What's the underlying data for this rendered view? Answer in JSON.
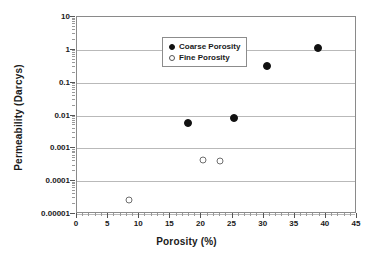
{
  "chart_data": {
    "type": "scatter",
    "title": "",
    "xlabel": "Porosity (%)",
    "ylabel": "Permeability (Darcys)",
    "xlim": [
      0,
      45
    ],
    "ylim": [
      1e-05,
      10
    ],
    "yscale": "log",
    "xscale": "linear",
    "grid": "horizontal-major-only",
    "legend_position": "top-left-inside",
    "xticks": [
      0,
      5,
      10,
      15,
      20,
      25,
      30,
      35,
      40,
      45
    ],
    "xtick_labels": [
      "0",
      "5",
      "10",
      "15",
      "20",
      "25",
      "30",
      "35",
      "40",
      "45"
    ],
    "xtick_minor_step": 1,
    "yticks": [
      10,
      1,
      0.1,
      0.01,
      0.001,
      0.0001,
      1e-05
    ],
    "ytick_labels": [
      "10",
      "1",
      "0.1",
      "0.01",
      "0.001",
      "0.0001",
      "0.00001"
    ],
    "series": [
      {
        "name": "Coarse Porosity",
        "marker": "filled-circle",
        "color": "#111111",
        "points": [
          {
            "x": 17.8,
            "y": 0.006
          },
          {
            "x": 25.2,
            "y": 0.0085
          },
          {
            "x": 30.5,
            "y": 0.32
          },
          {
            "x": 38.8,
            "y": 1.1
          }
        ]
      },
      {
        "name": "Fine Porosity",
        "marker": "open-circle",
        "color": "#6e6e6e",
        "points": [
          {
            "x": 8.4,
            "y": 2.7e-05
          },
          {
            "x": 20.3,
            "y": 0.00044
          },
          {
            "x": 23.0,
            "y": 0.00042
          }
        ]
      }
    ]
  },
  "legend": {
    "entries": [
      {
        "label": "Coarse Porosity",
        "marker": "filled-circle"
      },
      {
        "label": "Fine Porosity",
        "marker": "open-circle"
      }
    ]
  }
}
